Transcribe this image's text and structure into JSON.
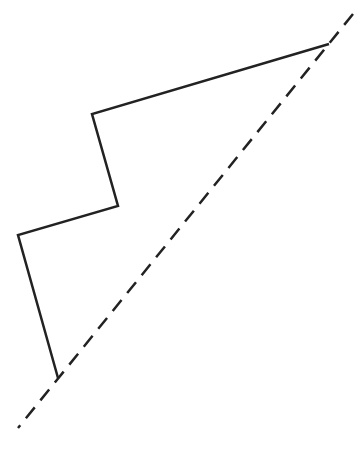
{
  "diagram": {
    "width": 361,
    "height": 476,
    "background": "#ffffff",
    "stroke_color": "#222222",
    "solid_path": {
      "points": [
        [
          329,
          44
        ],
        [
          92,
          114
        ],
        [
          118,
          206
        ],
        [
          18,
          235
        ],
        [
          58,
          378
        ]
      ],
      "stroke_width": 2.5
    },
    "dashed_line": {
      "start": [
        353,
        14
      ],
      "end": [
        18,
        428
      ],
      "stroke_width": 2.5,
      "dash": "14 9"
    }
  }
}
